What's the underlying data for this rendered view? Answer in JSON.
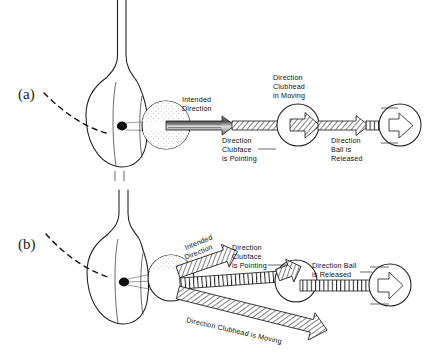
{
  "figure": {
    "background_color": "#ffffff",
    "ink_color": "#1b1b1b",
    "panels": [
      {
        "id": "a",
        "letter": "(a)",
        "description": "Square impact: clubhead path, clubface direction and ball release direction all coincide along the intended direction line.",
        "labels": [
          {
            "id": "intended-direction",
            "text_lines": [
              "Intended",
              "Direction"
            ]
          },
          {
            "id": "direction-clubface-is-pointing",
            "text_lines": [
              "Direction",
              "Clubface",
              "is Pointing"
            ]
          },
          {
            "id": "direction-clubhead-in-moving",
            "text_lines": [
              "Direction",
              "Clubhead",
              "in Moving"
            ]
          },
          {
            "id": "direction-ball-is-released",
            "text_lines": [
              "Direction",
              "Ball is",
              "Released"
            ]
          }
        ]
      },
      {
        "id": "b",
        "letter": "(b)",
        "description": "Open/out-to-in impact: clubhead path, clubface direction and ball release direction diverge from the intended direction line.",
        "labels": [
          {
            "id": "intended-direction",
            "text_lines": [
              "Intended",
              "Direction"
            ]
          },
          {
            "id": "direction-clubface-is-pointing",
            "text_lines": [
              "Direction",
              "Clubface",
              "is Pointing"
            ]
          },
          {
            "id": "direction-ball-is-released",
            "text_lines": [
              "Direction Ball",
              "is  Released"
            ]
          },
          {
            "id": "direction-clubhead-is-moving",
            "text_lines": [
              "Direction Clubhead is  Moving"
            ]
          }
        ]
      }
    ],
    "elements": {
      "clubhead": "driver-clubhead-silhouette",
      "shaft": "club-shaft",
      "cog": "center-of-gravity-dot",
      "ball": "golf-ball-with-dimples",
      "swing_arc": "dashed-swing-path"
    }
  }
}
